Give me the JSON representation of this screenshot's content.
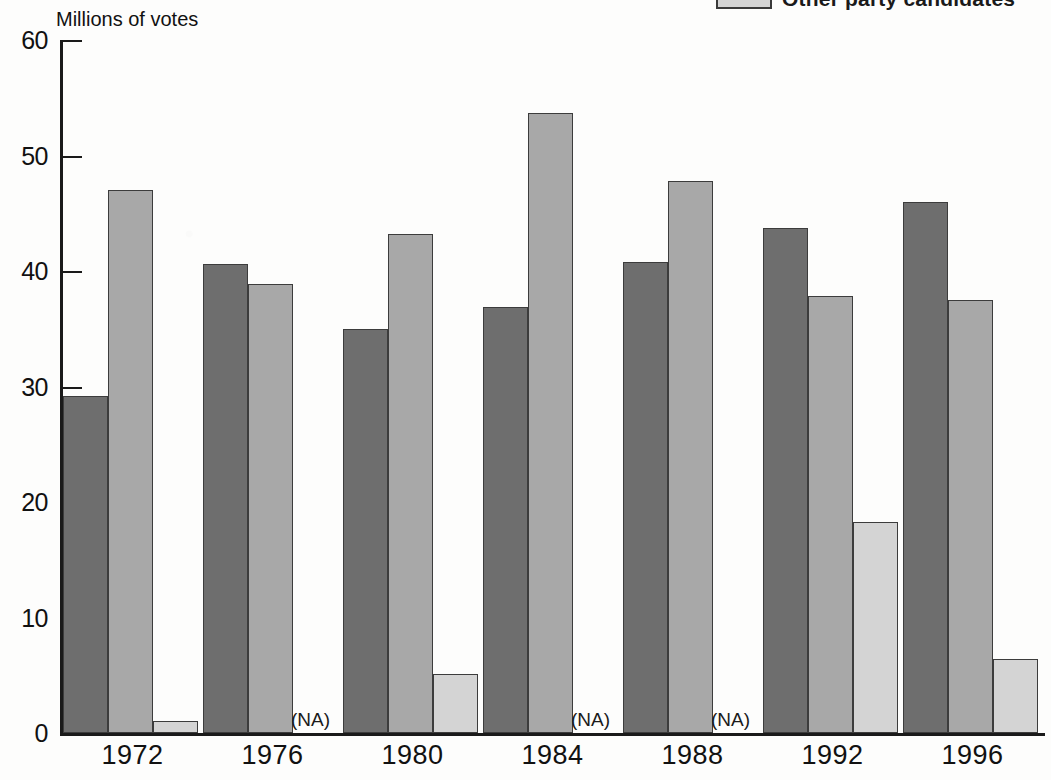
{
  "axis_title": "Millions of votes",
  "legend": {
    "swatch_color": "#d4d4d4",
    "label": "Other party candidates"
  },
  "colors": {
    "series_1": "#6e6e6e",
    "series_2": "#a8a8a8",
    "series_3": "#d4d4d4",
    "outline": "#3c3c3c",
    "axis": "#1a1a1a"
  },
  "na_text": "(NA)",
  "y_ticks": [
    "0",
    "10",
    "20",
    "30",
    "40",
    "50",
    "60"
  ],
  "chart_data": {
    "type": "bar",
    "title": "",
    "subtitle": "",
    "xlabel": "",
    "ylabel": "Millions of votes",
    "ylim": [
      0,
      60
    ],
    "yticks": [
      0,
      10,
      20,
      30,
      40,
      50,
      60
    ],
    "grid": false,
    "legend_position": "top-right",
    "categories": [
      "1972",
      "1976",
      "1980",
      "1984",
      "1988",
      "1992",
      "1996"
    ],
    "series": [
      {
        "name": "Series 1",
        "color": "#6e6e6e",
        "values": [
          29.2,
          40.6,
          35.0,
          36.9,
          40.8,
          43.7,
          46.0
        ]
      },
      {
        "name": "Series 2",
        "color": "#a8a8a8",
        "values": [
          47.0,
          38.9,
          43.2,
          53.7,
          47.8,
          37.8,
          37.5
        ]
      },
      {
        "name": "Other party candidates",
        "color": "#d4d4d4",
        "values": [
          1.0,
          null,
          5.1,
          null,
          null,
          18.3,
          6.4
        ],
        "na_labels": {
          "1976": "(NA)",
          "1984": "(NA)",
          "1988": "(NA)"
        }
      }
    ],
    "annotations": [
      {
        "text": "(NA)",
        "category": "1976",
        "series": "Other party candidates"
      },
      {
        "text": "(NA)",
        "category": "1984",
        "series": "Other party candidates"
      },
      {
        "text": "(NA)",
        "category": "1988",
        "series": "Other party candidates"
      }
    ]
  }
}
